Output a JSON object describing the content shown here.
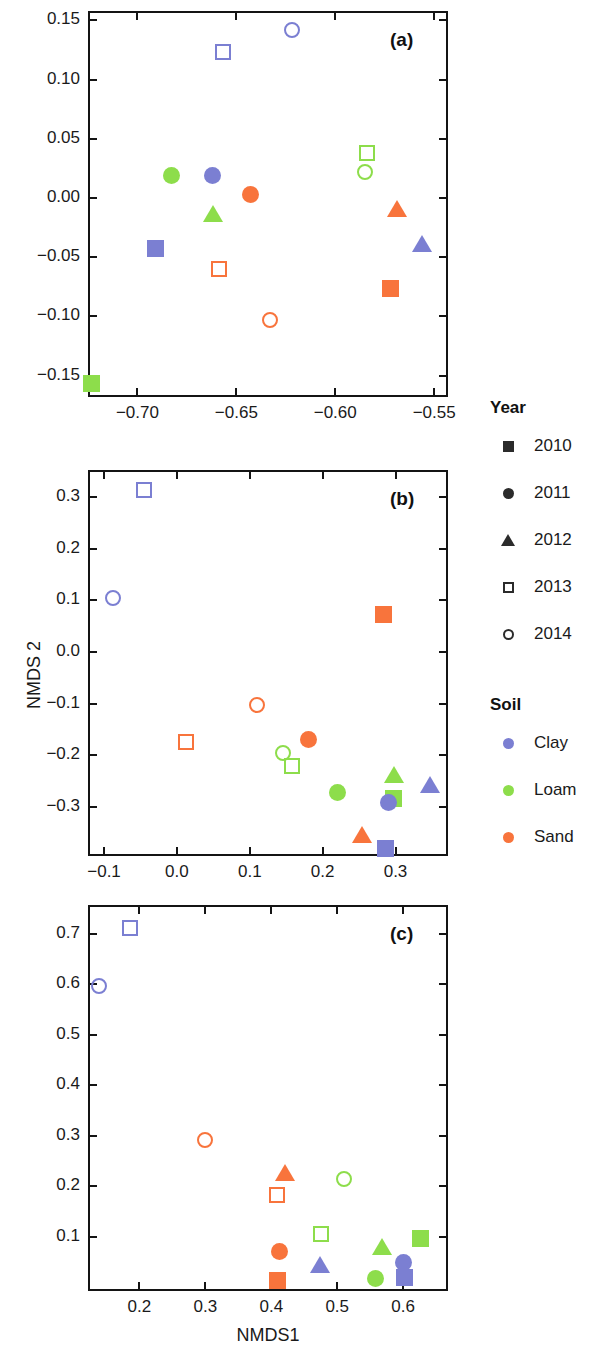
{
  "figure": {
    "axis_titles": {
      "x": "NMDS1",
      "y": "NMDS 2"
    },
    "colors": {
      "clay": "#7b7fd2",
      "loam": "#8ddd4b",
      "sand": "#f8743c",
      "axis": "#141414"
    }
  },
  "legend": {
    "year": {
      "title": "Year",
      "items": [
        {
          "label": "2010",
          "shape": "square-filled"
        },
        {
          "label": "2011",
          "shape": "circle-filled"
        },
        {
          "label": "2012",
          "shape": "triangle-filled"
        },
        {
          "label": "2013",
          "shape": "square-open"
        },
        {
          "label": "2014",
          "shape": "circle-open"
        }
      ]
    },
    "soil": {
      "title": "Soil",
      "items": [
        {
          "label": "Clay",
          "color": "#7b7fd2",
          "shape": "circle-filled"
        },
        {
          "label": "Loam",
          "color": "#8ddd4b",
          "shape": "circle-filled"
        },
        {
          "label": "Sand",
          "color": "#f8743c",
          "shape": "circle-filled"
        }
      ]
    }
  },
  "chart_data": [
    {
      "id": "a",
      "type": "scatter",
      "panel_label": "(a)",
      "xlabel": "",
      "ylabel": "",
      "xlim": [
        -0.725,
        -0.543
      ],
      "ylim": [
        -0.168,
        0.158
      ],
      "xticks": [
        -0.7,
        -0.65,
        -0.6,
        -0.55
      ],
      "yticks": [
        -0.15,
        -0.1,
        -0.05,
        0.0,
        0.05,
        0.1,
        0.15
      ],
      "xticklabels": [
        "−0.70",
        "−0.65",
        "−0.60",
        "−0.55"
      ],
      "yticklabels": [
        "−0.15",
        "−0.10",
        "−0.05",
        "0.00",
        "0.05",
        "0.10",
        "0.15"
      ],
      "grid": false,
      "points": [
        {
          "x": -0.622,
          "y": 0.142,
          "soil": "Clay",
          "year": "2014"
        },
        {
          "x": -0.657,
          "y": 0.123,
          "soil": "Clay",
          "year": "2013"
        },
        {
          "x": -0.584,
          "y": 0.038,
          "soil": "Loam",
          "year": "2013"
        },
        {
          "x": -0.585,
          "y": 0.022,
          "soil": "Loam",
          "year": "2014"
        },
        {
          "x": -0.683,
          "y": 0.019,
          "soil": "Loam",
          "year": "2011"
        },
        {
          "x": -0.662,
          "y": 0.019,
          "soil": "Clay",
          "year": "2011"
        },
        {
          "x": -0.643,
          "y": 0.003,
          "soil": "Sand",
          "year": "2011"
        },
        {
          "x": -0.569,
          "y": -0.01,
          "soil": "Sand",
          "year": "2012"
        },
        {
          "x": -0.662,
          "y": -0.014,
          "soil": "Loam",
          "year": "2012"
        },
        {
          "x": -0.556,
          "y": -0.039,
          "soil": "Clay",
          "year": "2012"
        },
        {
          "x": -0.691,
          "y": -0.043,
          "soil": "Clay",
          "year": "2010"
        },
        {
          "x": -0.659,
          "y": -0.06,
          "soil": "Sand",
          "year": "2013"
        },
        {
          "x": -0.572,
          "y": -0.076,
          "soil": "Sand",
          "year": "2010"
        },
        {
          "x": -0.633,
          "y": -0.103,
          "soil": "Sand",
          "year": "2014"
        },
        {
          "x": -0.723,
          "y": -0.157,
          "soil": "Loam",
          "year": "2010"
        }
      ]
    },
    {
      "id": "b",
      "type": "scatter",
      "panel_label": "(b)",
      "xlabel": "",
      "ylabel": "NMDS 2",
      "xlim": [
        -0.122,
        0.372
      ],
      "ylim": [
        -0.395,
        0.352
      ],
      "xticks": [
        -0.1,
        0.0,
        0.1,
        0.2,
        0.3
      ],
      "yticks": [
        -0.3,
        -0.2,
        -0.1,
        0.0,
        0.1,
        0.2,
        0.3
      ],
      "xticklabels": [
        "−0.1",
        "0.0",
        "0.1",
        "0.2",
        "0.3"
      ],
      "yticklabels": [
        "−0.3",
        "−0.2",
        "−0.1",
        "0.0",
        "0.1",
        "0.2",
        "0.3"
      ],
      "grid": false,
      "points": [
        {
          "x": -0.045,
          "y": 0.314,
          "soil": "Clay",
          "year": "2013"
        },
        {
          "x": -0.088,
          "y": 0.104,
          "soil": "Clay",
          "year": "2014"
        },
        {
          "x": 0.283,
          "y": 0.072,
          "soil": "Sand",
          "year": "2010"
        },
        {
          "x": 0.11,
          "y": -0.102,
          "soil": "Sand",
          "year": "2014"
        },
        {
          "x": 0.012,
          "y": -0.174,
          "soil": "Sand",
          "year": "2013"
        },
        {
          "x": 0.181,
          "y": -0.169,
          "soil": "Sand",
          "year": "2011"
        },
        {
          "x": 0.146,
          "y": -0.196,
          "soil": "Loam",
          "year": "2014"
        },
        {
          "x": 0.158,
          "y": -0.221,
          "soil": "Loam",
          "year": "2013"
        },
        {
          "x": 0.347,
          "y": -0.258,
          "soil": "Clay",
          "year": "2012"
        },
        {
          "x": 0.298,
          "y": -0.24,
          "soil": "Loam",
          "year": "2012"
        },
        {
          "x": 0.221,
          "y": -0.273,
          "soil": "Loam",
          "year": "2011"
        },
        {
          "x": 0.297,
          "y": -0.283,
          "soil": "Loam",
          "year": "2010"
        },
        {
          "x": 0.291,
          "y": -0.291,
          "soil": "Clay",
          "year": "2011"
        },
        {
          "x": 0.254,
          "y": -0.355,
          "soil": "Sand",
          "year": "2012"
        },
        {
          "x": 0.286,
          "y": -0.381,
          "soil": "Clay",
          "year": "2010"
        }
      ]
    },
    {
      "id": "c",
      "type": "scatter",
      "panel_label": "(c)",
      "xlabel": "NMDS1",
      "ylabel": "",
      "xlim": [
        0.122,
        0.668
      ],
      "ylim": [
        -0.008,
        0.757
      ],
      "xticks": [
        0.2,
        0.3,
        0.4,
        0.5,
        0.6
      ],
      "yticks": [
        0.1,
        0.2,
        0.3,
        0.4,
        0.5,
        0.6,
        0.7
      ],
      "xticklabels": [
        "0.2",
        "0.3",
        "0.4",
        "0.5",
        "0.6"
      ],
      "yticklabels": [
        "0.1",
        "0.2",
        "0.3",
        "0.4",
        "0.5",
        "0.6",
        "0.7"
      ],
      "grid": false,
      "points": [
        {
          "x": 0.185,
          "y": 0.712,
          "soil": "Clay",
          "year": "2013"
        },
        {
          "x": 0.138,
          "y": 0.596,
          "soil": "Clay",
          "year": "2014"
        },
        {
          "x": 0.3,
          "y": 0.291,
          "soil": "Sand",
          "year": "2014"
        },
        {
          "x": 0.421,
          "y": 0.224,
          "soil": "Sand",
          "year": "2012"
        },
        {
          "x": 0.51,
          "y": 0.213,
          "soil": "Loam",
          "year": "2014"
        },
        {
          "x": 0.408,
          "y": 0.183,
          "soil": "Sand",
          "year": "2013"
        },
        {
          "x": 0.475,
          "y": 0.105,
          "soil": "Loam",
          "year": "2013"
        },
        {
          "x": 0.626,
          "y": 0.096,
          "soil": "Loam",
          "year": "2010"
        },
        {
          "x": 0.568,
          "y": 0.079,
          "soil": "Loam",
          "year": "2012"
        },
        {
          "x": 0.412,
          "y": 0.071,
          "soil": "Sand",
          "year": "2011"
        },
        {
          "x": 0.6,
          "y": 0.048,
          "soil": "Clay",
          "year": "2011"
        },
        {
          "x": 0.474,
          "y": 0.042,
          "soil": "Clay",
          "year": "2012"
        },
        {
          "x": 0.602,
          "y": 0.018,
          "soil": "Clay",
          "year": "2010"
        },
        {
          "x": 0.558,
          "y": 0.017,
          "soil": "Loam",
          "year": "2011"
        },
        {
          "x": 0.41,
          "y": 0.012,
          "soil": "Sand",
          "year": "2010"
        }
      ]
    }
  ]
}
